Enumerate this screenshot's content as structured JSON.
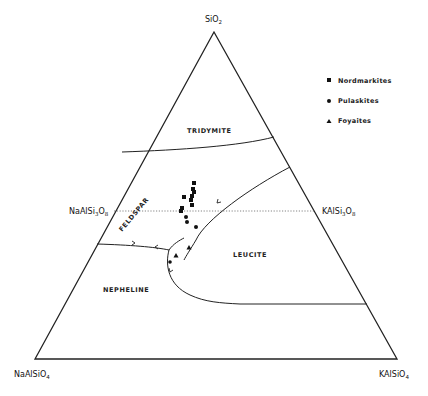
{
  "diagram": {
    "type": "ternary-phase-diagram",
    "vertices": {
      "top": {
        "label": "SiO",
        "subscript": "2"
      },
      "bottom_left": {
        "label": "NaAlSiO",
        "subscript": "4"
      },
      "bottom_right": {
        "label": "KAlSiO",
        "subscript": "4"
      }
    },
    "join_labels": {
      "left": {
        "label_a": "NaAlSi",
        "sub_a": "3",
        "label_b": "O",
        "sub_b": "8"
      },
      "right": {
        "label_a": "KAlSi",
        "sub_a": "3",
        "label_b": "O",
        "sub_b": "8"
      }
    },
    "fields": {
      "tridymite": "TRIDYMITE",
      "feldspar": "FELDSPAR",
      "leucite": "LEUCITE",
      "nepheline": "NEPHELINE"
    },
    "legend": [
      {
        "symbol": "square",
        "label": "Nordmarkites"
      },
      {
        "symbol": "circle",
        "label": "Pulaskites"
      },
      {
        "symbol": "triangle",
        "label": "Foyaites"
      }
    ],
    "data_points": {
      "nordmarkites": [
        [
          194,
          183
        ],
        [
          193,
          189
        ],
        [
          194,
          192
        ],
        [
          192,
          196
        ],
        [
          191,
          200
        ],
        [
          184,
          197
        ],
        [
          182,
          208
        ],
        [
          181,
          211
        ],
        [
          192,
          205
        ]
      ],
      "pulaskites": [
        [
          186,
          217
        ],
        [
          187,
          222
        ],
        [
          196,
          227
        ],
        [
          183,
          248
        ]
      ],
      "foyaites": [
        [
          189,
          248
        ],
        [
          175,
          256
        ],
        [
          171,
          262
        ]
      ]
    }
  }
}
